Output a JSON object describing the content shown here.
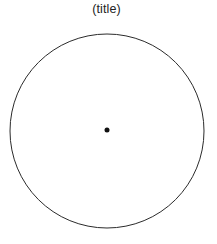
{
  "figure": {
    "title": "(title)",
    "background_color": "#ffffff",
    "width": 217,
    "height": 244
  },
  "chart_data": {
    "type": "scatter",
    "title": "(title)",
    "xlabel": "",
    "ylabel": "",
    "grid": false,
    "legend": null,
    "axes_visible": false,
    "tick_labels_x": [],
    "tick_labels_y": [],
    "shapes": [
      {
        "name": "circle-outline",
        "kind": "circle",
        "center_x": 107,
        "center_y": 131,
        "radius": 97,
        "fill": "none",
        "stroke": "#2b2b2b",
        "stroke_width": 1
      }
    ],
    "points": [
      {
        "name": "center-point",
        "x": 107,
        "y": 130,
        "marker": "filled-circle",
        "marker_size": 5,
        "color": "#111111"
      }
    ]
  },
  "colors": {
    "stroke": "#2b2b2b",
    "point": "#111111",
    "title_text": "#232323",
    "background": "#ffffff"
  },
  "icons": {
    "center_point": "dot-icon",
    "outline": "circle-outline-icon"
  }
}
